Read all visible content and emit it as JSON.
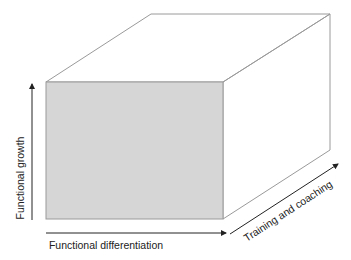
{
  "diagram": {
    "type": "3d-cube-model",
    "colors": {
      "front_face": "#d6d6d6",
      "edges": "#9a9a9a",
      "arrows": "#222222",
      "text": "#222222"
    },
    "axes": {
      "vertical": {
        "label": "Functional growth"
      },
      "horizontal": {
        "label": "Functional differentiation"
      },
      "depth": {
        "label": "Training and coaching"
      }
    }
  }
}
